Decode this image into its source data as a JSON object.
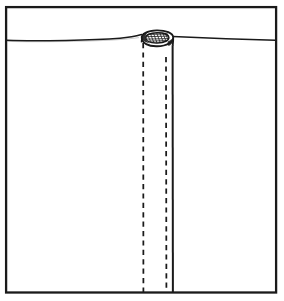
{
  "figure": {
    "title": "Cross-sectional technical line drawing",
    "style": "monochrome ink line drawing",
    "colors": {
      "background": "#ffffff",
      "ink": "#1a1a1a",
      "frame": "#1a1a1a",
      "fill": "#ffffff"
    },
    "canvas": {
      "width": 284,
      "height": 301
    },
    "frame": {
      "name": "border-rectangle",
      "x": 5,
      "y": 6,
      "width": 272,
      "height": 287,
      "stroke_width": 2.2
    },
    "ground": {
      "name": "ground-surface-line",
      "label": "surface line",
      "left_y": 40,
      "peak_y": 35,
      "right_y": 40,
      "stroke_width": 1.5,
      "path": "M 6 40 C 30 40.8 60 40.4 92 39.6 C 118 38.9 132 36.6 141 34.6 M 173 36.4 C 200 37.6 234 38.9 276 40.2"
    },
    "tube": {
      "name": "cylindrical-tube",
      "left_wall_x": 142,
      "right_wall_x": 172.5,
      "top_y": 33,
      "bottom_y": 293,
      "outer_diameter_px": 30.5,
      "stroke_width": 1.8
    },
    "ellipse_top": {
      "name": "tube-open-end-ellipse",
      "center_x": 157,
      "center_y": 41,
      "rx": 15.6,
      "ry": 8.2,
      "rotation_deg": -9,
      "inner_rx": 11.2,
      "inner_ry": 5.0,
      "shading": "dense cross-hatching inside rim"
    },
    "hidden_lines": [
      {
        "name": "hidden-line-left-bore",
        "x": 143,
        "y_start": 42,
        "y_end": 293,
        "dash": "5,4",
        "stroke_width": 1.7
      },
      {
        "name": "hidden-line-right-bore",
        "x": 166,
        "y_start": 56,
        "y_end": 293,
        "dash": "5,4",
        "stroke_width": 1.7
      }
    ],
    "solid_lines": [
      {
        "name": "tube-right-wall-solid",
        "x": 172.5,
        "y_start": 46,
        "y_end": 293,
        "stroke_width": 2.0
      }
    ]
  }
}
